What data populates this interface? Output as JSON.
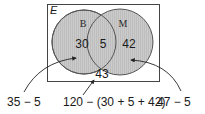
{
  "diagram": {
    "type": "venn",
    "universe_label": "E",
    "sets": [
      {
        "label": "B",
        "only_count": "30"
      },
      {
        "label": "M",
        "only_count": "42"
      }
    ],
    "intersection_count": "5",
    "outside_count": "43",
    "annotations": {
      "left": "35 − 5",
      "middle": "120 − (30 + 5 + 42)",
      "right": "47 − 5"
    },
    "colors": {
      "circle_fill": "#c8c8c8",
      "circle_stroke": "#555555",
      "frame_stroke": "#444444",
      "arrow": "#222222"
    }
  }
}
